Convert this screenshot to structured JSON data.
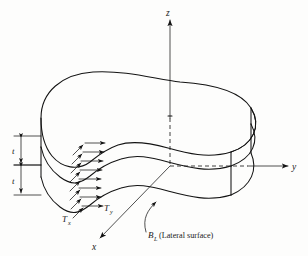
{
  "figure": {
    "background_color": "#fdfdfc",
    "ink_color": "#131313"
  },
  "axes": {
    "z_label": "z",
    "y_label": "y",
    "x_label": "x"
  },
  "dimensions": [
    {
      "label": "t",
      "name": "upper-layer-thickness"
    },
    {
      "label": "t",
      "name": "lower-layer-thickness"
    }
  ],
  "tractions": {
    "in_plane_label": "T",
    "in_plane_subscript": "y",
    "out_of_plane_label": "T",
    "out_of_plane_subscript": "x",
    "horizontal_arrow_count": 8,
    "diagonal_arrow_count": 7
  },
  "annotations": {
    "lateral_surface_symbol": "B",
    "lateral_surface_subscript": "L",
    "lateral_surface_text": "(Lateral surface)"
  }
}
